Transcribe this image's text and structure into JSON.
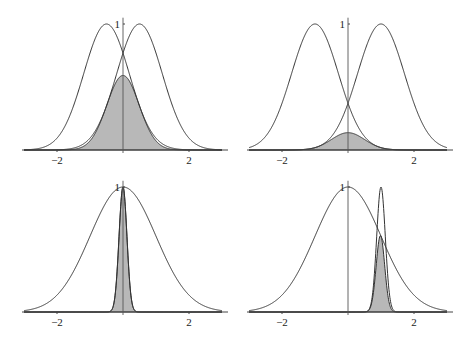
{
  "chart_data": [
    {
      "type": "line",
      "title": "",
      "panel": "top-left",
      "xlim": [
        -3,
        3
      ],
      "ylim": [
        0,
        1
      ],
      "xticks": [
        "-2",
        "2"
      ],
      "yticks": [
        "1"
      ],
      "series": [
        {
          "name": "gaussian-left",
          "mean": -0.5,
          "sigma": 0.69,
          "peak": 1
        },
        {
          "name": "gaussian-right",
          "mean": 0.5,
          "sigma": 0.69,
          "peak": 1
        },
        {
          "name": "product (shaded)",
          "mean": 0,
          "peak": 0.59,
          "shaded": true
        }
      ]
    },
    {
      "type": "line",
      "title": "",
      "panel": "top-right",
      "xlim": [
        -3,
        3
      ],
      "ylim": [
        0,
        1
      ],
      "xticks": [
        "-2",
        "2"
      ],
      "yticks": [
        "1"
      ],
      "series": [
        {
          "name": "gaussian-left",
          "mean": -1,
          "sigma": 0.71,
          "peak": 1
        },
        {
          "name": "gaussian-right",
          "mean": 1,
          "sigma": 0.71,
          "peak": 1
        },
        {
          "name": "product (shaded)",
          "mean": 0,
          "peak": 0.135,
          "shaded": true
        }
      ]
    },
    {
      "type": "line",
      "title": "",
      "panel": "bottom-left",
      "xlim": [
        -3,
        3
      ],
      "ylim": [
        0,
        1
      ],
      "xticks": [
        "-2",
        "2"
      ],
      "yticks": [
        "1"
      ],
      "series": [
        {
          "name": "gaussian-wide",
          "mean": 0,
          "sigma": 1.0,
          "peak": 1
        },
        {
          "name": "gaussian-narrow",
          "mean": 0,
          "sigma": 0.12,
          "peak": 1
        },
        {
          "name": "product (shaded)",
          "mean": 0,
          "peak": 1,
          "shaded": true
        }
      ]
    },
    {
      "type": "line",
      "title": "",
      "panel": "bottom-right",
      "xlim": [
        -3,
        3
      ],
      "ylim": [
        0,
        1
      ],
      "xticks": [
        "-2",
        "2"
      ],
      "yticks": [
        "1"
      ],
      "series": [
        {
          "name": "gaussian-wide",
          "mean": 0,
          "sigma": 1.0,
          "peak": 1
        },
        {
          "name": "gaussian-narrow",
          "mean": 1,
          "sigma": 0.13,
          "peak": 1
        },
        {
          "name": "product (shaded)",
          "mean": 1,
          "peak": 0.61,
          "shaded": true
        }
      ]
    }
  ],
  "labels": {
    "neg2": "−2",
    "pos2": "2",
    "one": "1"
  }
}
